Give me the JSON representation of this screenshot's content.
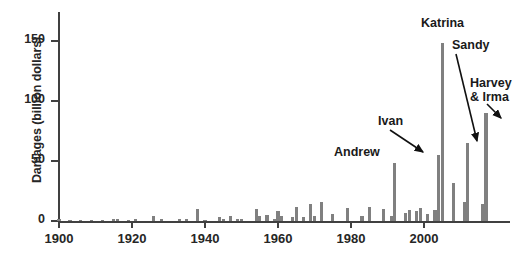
{
  "chart_data": {
    "type": "bar",
    "title": "",
    "xlabel": "",
    "ylabel": "Damages (billion dollars)",
    "xlim": [
      1900,
      2018
    ],
    "ylim": [
      0,
      160
    ],
    "grid": false,
    "legend": null,
    "bar_color": "#808080",
    "axis_color": "#404040",
    "xticks": [
      1900,
      1920,
      1940,
      1960,
      1980,
      2000
    ],
    "yticks": [
      0,
      50,
      100,
      150
    ],
    "x": [
      1900,
      1903,
      1906,
      1909,
      1912,
      1915,
      1916,
      1919,
      1921,
      1926,
      1928,
      1933,
      1935,
      1938,
      1940,
      1944,
      1945,
      1947,
      1949,
      1950,
      1954,
      1955,
      1957,
      1959,
      1960,
      1961,
      1964,
      1965,
      1967,
      1969,
      1970,
      1972,
      1975,
      1979,
      1983,
      1985,
      1989,
      1991,
      1992,
      1995,
      1996,
      1998,
      1999,
      2001,
      2003,
      2004,
      2005,
      2008,
      2011,
      2012,
      2016,
      2017
    ],
    "values": [
      1.5,
      1,
      1,
      1,
      1,
      2,
      2,
      1,
      1.5,
      4,
      2,
      1.5,
      2,
      10,
      1,
      3,
      2,
      4,
      2,
      2,
      10,
      4,
      5,
      2,
      8,
      4,
      3,
      12,
      3,
      14,
      4,
      16,
      6,
      11,
      4,
      12,
      10,
      4,
      48,
      7,
      9,
      8,
      11,
      6,
      9,
      55,
      148,
      32,
      16,
      65,
      14,
      90
    ],
    "annotations": [
      {
        "label": "Andrew",
        "year": 1992,
        "value": 48,
        "arrow": false
      },
      {
        "label": "Ivan",
        "year": 2004,
        "value": 55,
        "arrow": true
      },
      {
        "label": "Katrina",
        "year": 2005,
        "value": 148,
        "arrow": false
      },
      {
        "label": "Sandy",
        "year": 2012,
        "value": 65,
        "arrow": true
      },
      {
        "label": "Harvey & Irma",
        "year": 2017,
        "value": 90,
        "arrow": true
      }
    ]
  },
  "yaxis": {
    "title": "Damages (billion dollars)",
    "ticks": [
      {
        "label": "150",
        "value": 150
      },
      {
        "label": "100",
        "value": 100
      },
      {
        "label": "50",
        "value": 50
      },
      {
        "label": "0",
        "value": 0
      }
    ]
  },
  "xaxis": {
    "ticks": [
      {
        "label": "1900",
        "value": 1900
      },
      {
        "label": "1920",
        "value": 1920
      },
      {
        "label": "1940",
        "value": 1940
      },
      {
        "label": "1960",
        "value": 1960
      },
      {
        "label": "1980",
        "value": 1980
      },
      {
        "label": "2000",
        "value": 2000
      }
    ]
  },
  "annotations": {
    "katrina": "Katrina",
    "sandy": "Sandy",
    "harvey_line1": "Harvey",
    "harvey_line2": "& Irma",
    "ivan": "Ivan",
    "andrew": "Andrew"
  }
}
